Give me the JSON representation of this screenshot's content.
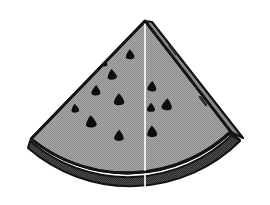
{
  "image": {
    "title": "Watermelon Wedge",
    "subject": "watermelon-slice",
    "style": "grayscale line art with halftone dither shading",
    "background_color": "#ffffff",
    "width": 270,
    "height": 205
  },
  "palette": {
    "background": "#ffffff",
    "flesh_fill": "#9c9c9c",
    "flesh_fill_light": "#a8a8a8",
    "rind_band": "#8f8f8f",
    "side_face": "#8a8a8a",
    "side_face_dark": "#5e5e5e",
    "bottom_shadow": "#3a3a3a",
    "outline": "#141414",
    "seed_color": "#0d0d0d",
    "highlight_line": "#ffffff"
  },
  "geometry": {
    "apex": {
      "x": 145,
      "y": 20
    },
    "left_corner": {
      "x": 29,
      "y": 140
    },
    "right_corner": {
      "x": 232,
      "y": 131
    },
    "bottom_extent_y": 193,
    "left_extent_x": 28,
    "right_extent_x": 245,
    "radius_outer": 152,
    "rind_thickness": 13,
    "side_face_width": 16
  },
  "parts": [
    {
      "name": "flesh-face",
      "label": "Front flesh face",
      "fill": "#9c9c9c"
    },
    {
      "name": "rind-band",
      "label": "Curved rind band",
      "fill": "#8f8f8f"
    },
    {
      "name": "side-face",
      "label": "Right depth face",
      "fill": "#8a8a8a"
    },
    {
      "name": "bottom-shadow",
      "label": "Bottom shadow under rind",
      "fill": "#3a3a3a"
    },
    {
      "name": "corner-block",
      "label": "Right rind corner block",
      "fill": "#6a6a6a"
    }
  ],
  "seeds": {
    "count": 12,
    "shape": "teardrop",
    "color": "#0d0d0d",
    "positions": [
      {
        "x": 130,
        "y": 54,
        "r": 5.0,
        "rot": -4
      },
      {
        "x": 112,
        "y": 74,
        "r": 5.4,
        "rot": -6
      },
      {
        "x": 96,
        "y": 90,
        "r": 5.2,
        "rot": 3
      },
      {
        "x": 119,
        "y": 99,
        "r": 6.0,
        "rot": -2
      },
      {
        "x": 91,
        "y": 121,
        "r": 6.2,
        "rot": -5
      },
      {
        "x": 119,
        "y": 135,
        "r": 5.6,
        "rot": 2
      },
      {
        "x": 152,
        "y": 86,
        "r": 5.2,
        "rot": 4
      },
      {
        "x": 167,
        "y": 104,
        "r": 6.0,
        "rot": 6
      },
      {
        "x": 152,
        "y": 131,
        "r": 5.8,
        "rot": -3
      },
      {
        "x": 151,
        "y": 107,
        "r": 4.6,
        "rot": 0
      },
      {
        "x": 75,
        "y": 108,
        "r": 4.4,
        "rot": -8
      },
      {
        "x": 104,
        "y": 62,
        "r": 4.2,
        "rot": 5
      }
    ]
  },
  "side_face_dashes": {
    "count": 3,
    "color": "#2a2a2a",
    "description": "short dark dashes along the right depth face"
  },
  "highlight": {
    "name": "center-highlight-line",
    "description": "vertical white line from apex down to bottom edge",
    "x": 145,
    "y_start": 22,
    "y_end": 190,
    "color": "#ffffff",
    "width": 1.6
  }
}
